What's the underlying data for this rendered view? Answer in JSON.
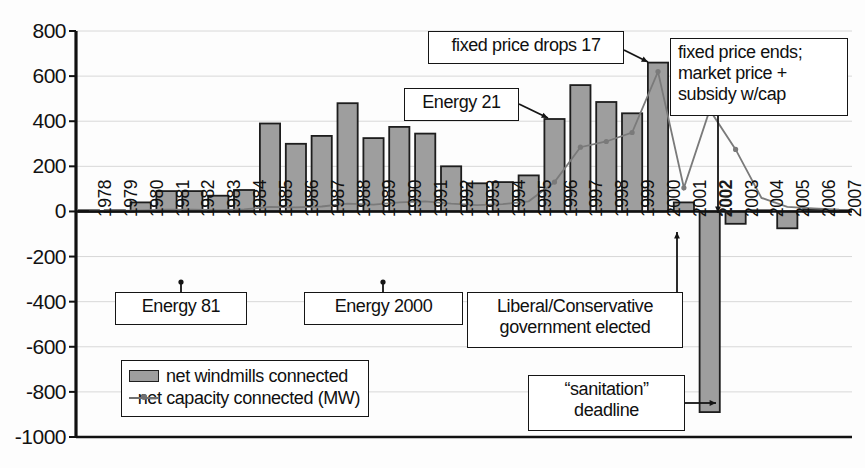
{
  "chart_data": {
    "type": "bar",
    "title": "",
    "xlabel": "",
    "ylabel": "",
    "ylim": [
      -1000,
      800
    ],
    "grid": true,
    "legend_position": "bottom-left",
    "categories": [
      "1978",
      "1979",
      "1980",
      "1981",
      "1982",
      "1983",
      "1984",
      "1985",
      "1986",
      "1987",
      "1988",
      "1989",
      "1990",
      "1991",
      "1992",
      "1993",
      "1994",
      "1995",
      "1996",
      "1997",
      "1998",
      "1999",
      "2000",
      "2001",
      "2002",
      "2003",
      "2004",
      "2005",
      "2006",
      "2007"
    ],
    "yticks": [
      "800",
      "600",
      "400",
      "200",
      "0",
      "-200",
      "-400",
      "-600",
      "-800",
      "-1000"
    ],
    "series": [
      {
        "name": "net windmills connected",
        "type": "bar",
        "color": "#9e9e9e",
        "values": [
          5,
          5,
          40,
          90,
          90,
          70,
          95,
          390,
          300,
          335,
          480,
          325,
          375,
          345,
          200,
          125,
          130,
          160,
          410,
          560,
          485,
          435,
          660,
          40,
          -890,
          -55,
          5,
          -75,
          10,
          5
        ]
      },
      {
        "name": "net capacity connected (MW)",
        "type": "line",
        "color": "#7a7a7a",
        "values": [
          2,
          2,
          4,
          8,
          8,
          6,
          9,
          20,
          18,
          22,
          35,
          30,
          40,
          45,
          35,
          28,
          32,
          45,
          130,
          285,
          310,
          350,
          620,
          105,
          450,
          275,
          60,
          20,
          14,
          8
        ]
      }
    ]
  },
  "callouts": [
    {
      "id": "fixed-price-drops",
      "text": "fixed price drops 17"
    },
    {
      "id": "energy-21",
      "text": "Energy 21"
    },
    {
      "id": "fixed-price-ends",
      "text": "fixed price ends;\nmarket price +\nsubsidy w/cap"
    },
    {
      "id": "energy-81",
      "text": "Energy 81"
    },
    {
      "id": "energy-2000",
      "text": "Energy 2000"
    },
    {
      "id": "government-elected",
      "text": "Liberal/Conservative\ngovernment elected"
    },
    {
      "id": "sanitation-deadline",
      "text": "“sanitation”\ndeadline"
    }
  ],
  "legend": {
    "bar_label": "net windmills connected",
    "line_label": "net capacity connected (MW)"
  },
  "caption": {
    "text": ""
  },
  "colors": {
    "bar_fill": "#9e9e9e",
    "bar_stroke": "#1d1d1d",
    "line": "#7a7a7a",
    "axis": "#111111",
    "grid": "#d8d8d8"
  }
}
